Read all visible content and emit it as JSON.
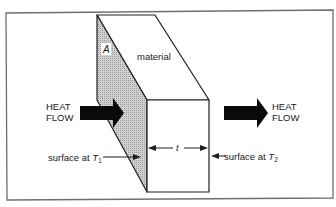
{
  "diagram": {
    "colors": {
      "frame": "#6e6e6e",
      "outline": "#1e1e1e",
      "arrow": "#0a0a0a",
      "shade": "#c4c4c4",
      "text": "#1a1a1a"
    },
    "labels": {
      "area": "A",
      "material": "material",
      "thickness": "t",
      "heat_flow_in_line1": "HEAT",
      "heat_flow_in_line2": "FLOW",
      "heat_flow_out_line1": "HEAT",
      "heat_flow_out_line2": "FLOW",
      "surface_t1_prefix": "surface at ",
      "surface_t1_var": "T",
      "surface_t1_sub": "1",
      "surface_t2_prefix": "surface at ",
      "surface_t2_var": "T",
      "surface_t2_sub": "2"
    }
  }
}
